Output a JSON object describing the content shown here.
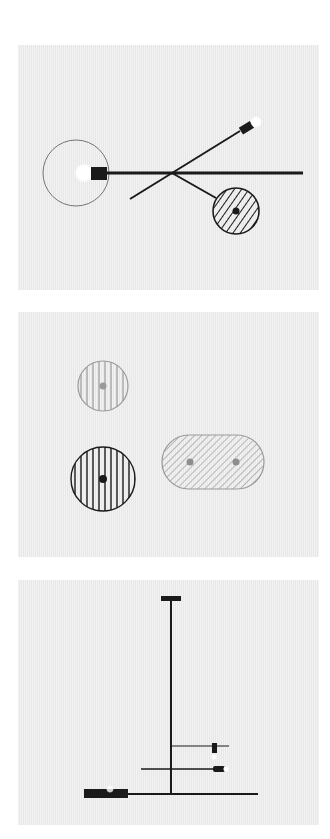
{
  "diagram": {
    "title": "",
    "colors": {
      "background": "#ffffff",
      "panel": "#ececec",
      "ink": "#1a1a1a",
      "gray_ink": "#9a9a9a",
      "glow": "#ffffff"
    },
    "panels": [
      {
        "id": "panel-1",
        "top": 45,
        "elements": [
          {
            "type": "circle-outline",
            "cx": 76,
            "cy": 173,
            "r": 33
          },
          {
            "type": "glow",
            "cx": 84,
            "cy": 173,
            "r": 9
          },
          {
            "type": "block",
            "x": 91,
            "y": 167,
            "w": 16,
            "h": 13
          },
          {
            "type": "line",
            "x1": 107,
            "y1": 173,
            "x2": 303,
            "y2": 173,
            "width": 3
          },
          {
            "type": "line",
            "x1": 130,
            "y1": 199,
            "x2": 240,
            "y2": 131,
            "width": 2
          },
          {
            "type": "angled-block",
            "cx": 246,
            "cy": 128,
            "angle": -32
          },
          {
            "type": "glow",
            "cx": 256,
            "cy": 122,
            "r": 5
          },
          {
            "type": "line",
            "x1": 172,
            "y1": 173,
            "x2": 216,
            "y2": 198,
            "width": 2
          },
          {
            "type": "hatched-circle",
            "cx": 236,
            "cy": 211,
            "r": 23,
            "hatch": "diagonal",
            "dot": "black"
          }
        ]
      },
      {
        "id": "panel-2",
        "top": 312,
        "elements": [
          {
            "type": "hatched-circle",
            "cx": 103,
            "cy": 386,
            "r": 25,
            "hatch": "vertical",
            "tone": "gray",
            "dot": "gray"
          },
          {
            "type": "hatched-circle",
            "cx": 103,
            "cy": 479,
            "r": 32,
            "hatch": "vertical",
            "tone": "black",
            "dot": "black"
          },
          {
            "type": "hatched-stadium",
            "x": 162,
            "y": 435,
            "w": 102,
            "h": 54,
            "hatch": "diagonal",
            "tone": "gray",
            "dots": [
              [
                190,
                462
              ],
              [
                236,
                462
              ]
            ]
          }
        ]
      },
      {
        "id": "panel-3",
        "top": 580,
        "elements": [
          {
            "type": "line",
            "x1": 171,
            "y1": 598,
            "x2": 171,
            "y2": 794,
            "width": 2
          },
          {
            "type": "block",
            "x": 161,
            "y": 596,
            "w": 20,
            "h": 5
          },
          {
            "type": "line",
            "x1": 171,
            "y1": 746,
            "x2": 229,
            "y2": 746,
            "width": 1
          },
          {
            "type": "block",
            "x": 212,
            "y": 743,
            "w": 5,
            "h": 10
          },
          {
            "type": "glow",
            "cx": 214,
            "cy": 757,
            "r": 3
          },
          {
            "type": "line",
            "x1": 141,
            "y1": 769,
            "x2": 225,
            "y2": 769,
            "width": 1.5
          },
          {
            "type": "block",
            "x": 213,
            "y": 766,
            "w": 12,
            "h": 6
          },
          {
            "type": "glow",
            "cx": 226,
            "cy": 769,
            "r": 3
          },
          {
            "type": "line",
            "x1": 84,
            "y1": 794,
            "x2": 258,
            "y2": 794,
            "width": 2
          },
          {
            "type": "block",
            "x": 84,
            "y": 789,
            "w": 44,
            "h": 9
          },
          {
            "type": "glow",
            "cx": 110,
            "cy": 789,
            "r": 4
          }
        ]
      }
    ]
  }
}
